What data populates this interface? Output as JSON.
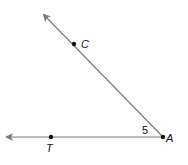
{
  "diagram": {
    "type": "angle",
    "vertex": {
      "label": "A",
      "x": 163,
      "y": 137
    },
    "rays": [
      {
        "name": "ray-AC",
        "through": {
          "label": "C",
          "x": 74,
          "y": 44
        },
        "tip": {
          "x": 43,
          "y": 14
        }
      },
      {
        "name": "ray-AT",
        "through": {
          "label": "T",
          "x": 51,
          "y": 137
        },
        "tip": {
          "x": 6,
          "y": 137
        }
      }
    ],
    "angle_label": "5",
    "colors": {
      "line": "#7a7a7a",
      "point": "#111111",
      "text": "#111111"
    }
  },
  "labels": {
    "C": "C",
    "T": "T",
    "A": "A",
    "angle": "5"
  }
}
